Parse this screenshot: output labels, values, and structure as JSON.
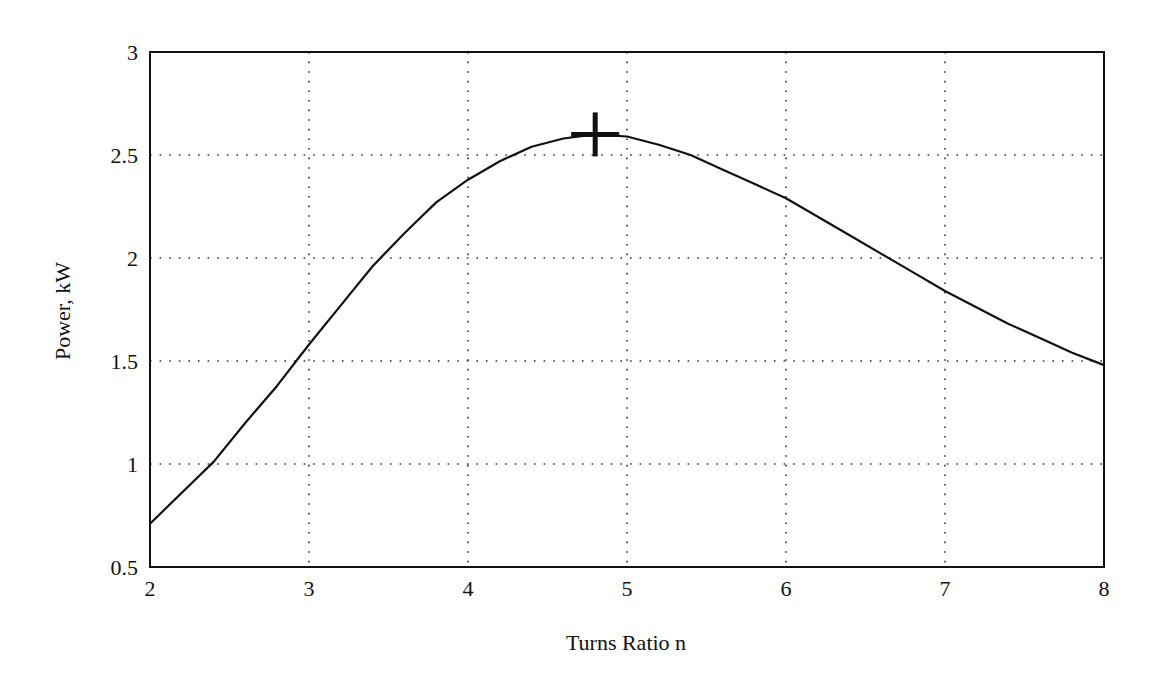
{
  "chart_data": {
    "type": "line",
    "title": "",
    "xlabel": "Turns Ratio n",
    "ylabel": "Power, kW",
    "xlim": [
      2,
      8
    ],
    "ylim": [
      0.5,
      3
    ],
    "xticks": [
      2,
      3,
      4,
      5,
      6,
      7,
      8
    ],
    "yticks": [
      0.5,
      1,
      1.5,
      2,
      2.5,
      3
    ],
    "xtick_labels": [
      "2",
      "3",
      "4",
      "5",
      "6",
      "7",
      "8"
    ],
    "ytick_labels": [
      "0.5",
      "1",
      "1.5",
      "2",
      "2.5",
      "3"
    ],
    "grid": true,
    "grid_style": "dotted",
    "legend": null,
    "series": [
      {
        "name": "Power",
        "color": "#111111",
        "x": [
          2.0,
          2.2,
          2.4,
          2.6,
          2.8,
          3.0,
          3.2,
          3.4,
          3.6,
          3.8,
          4.0,
          4.2,
          4.4,
          4.6,
          4.8,
          5.0,
          5.2,
          5.4,
          5.6,
          5.8,
          6.0,
          6.2,
          6.4,
          6.6,
          6.8,
          7.0,
          7.2,
          7.4,
          7.6,
          7.8,
          8.0
        ],
        "y": [
          0.71,
          0.86,
          1.01,
          1.2,
          1.38,
          1.58,
          1.77,
          1.96,
          2.12,
          2.27,
          2.38,
          2.47,
          2.54,
          2.58,
          2.6,
          2.59,
          2.55,
          2.5,
          2.43,
          2.36,
          2.29,
          2.2,
          2.11,
          2.02,
          1.93,
          1.84,
          1.76,
          1.68,
          1.61,
          1.54,
          1.48
        ]
      }
    ],
    "annotations": [
      {
        "type": "marker",
        "symbol": "+",
        "x": 4.8,
        "y": 2.6,
        "label": "maximum power point"
      }
    ]
  }
}
